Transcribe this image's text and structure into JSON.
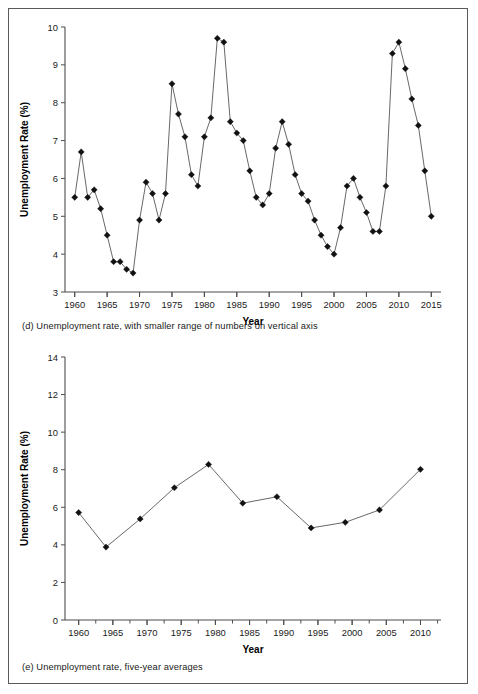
{
  "figure": {
    "panels": [
      {
        "id": "d",
        "caption": "(d) Unemployment rate, with smaller range of numbers on vertical axis"
      },
      {
        "id": "e",
        "caption": "(e) Unemployment rate, five-year averages"
      }
    ]
  },
  "chart_data": [
    {
      "type": "line",
      "title": "",
      "panel_label": "(d)",
      "xlabel": "Year",
      "ylabel": "Unemployment Rate (%)",
      "xlim": [
        1958.5,
        2016.5
      ],
      "ylim": [
        3,
        10
      ],
      "yticks": [
        3,
        4,
        5,
        6,
        7,
        8,
        9,
        10
      ],
      "ytick_labels": [
        "3",
        "4",
        "5",
        "6",
        "7",
        "8",
        "9",
        "10"
      ],
      "xticks": [
        1960,
        1965,
        1970,
        1975,
        1980,
        1985,
        1990,
        1995,
        2000,
        2005,
        2010,
        2015
      ],
      "xtick_labels": [
        "1960",
        "1965",
        "1970",
        "1975",
        "1980",
        "1985",
        "1990",
        "1995",
        "2000",
        "2005",
        "2010",
        "2015"
      ],
      "grid": false,
      "legend": false,
      "marker": "diamond",
      "x": [
        1960,
        1961,
        1962,
        1963,
        1964,
        1965,
        1966,
        1967,
        1968,
        1969,
        1970,
        1971,
        1972,
        1973,
        1974,
        1975,
        1976,
        1977,
        1978,
        1979,
        1980,
        1981,
        1982,
        1983,
        1984,
        1985,
        1986,
        1987,
        1988,
        1989,
        1990,
        1991,
        1992,
        1993,
        1994,
        1995,
        1996,
        1997,
        1998,
        1999,
        2000,
        2001,
        2002,
        2003,
        2004,
        2005,
        2006,
        2007,
        2008,
        2009,
        2010,
        2011,
        2012,
        2013,
        2014,
        2015
      ],
      "values": [
        5.5,
        6.7,
        5.5,
        5.7,
        5.2,
        4.5,
        3.8,
        3.8,
        3.6,
        3.5,
        4.9,
        5.9,
        5.6,
        4.9,
        5.6,
        8.5,
        7.7,
        7.1,
        6.1,
        5.8,
        7.1,
        7.6,
        9.7,
        9.6,
        7.5,
        7.2,
        7.0,
        6.2,
        5.5,
        5.3,
        5.6,
        6.8,
        7.5,
        6.9,
        6.1,
        5.6,
        5.4,
        4.9,
        4.5,
        4.2,
        4.0,
        4.7,
        5.8,
        6.0,
        5.5,
        5.1,
        4.6,
        4.6,
        5.8,
        9.3,
        9.6,
        8.9,
        8.1,
        7.4,
        6.2,
        5.0
      ],
      "xtick_minor_every": 1
    },
    {
      "type": "line",
      "title": "",
      "panel_label": "(e)",
      "xlabel": "Year",
      "ylabel": "Unemployment Rate (%)",
      "xlim": [
        1958,
        2013
      ],
      "ylim": [
        0,
        14
      ],
      "yticks": [
        0,
        2,
        4,
        6,
        8,
        10,
        12,
        14
      ],
      "ytick_labels": [
        "0",
        "2",
        "4",
        "6",
        "8",
        "10",
        "12",
        "14"
      ],
      "xticks": [
        1960,
        1965,
        1970,
        1975,
        1980,
        1985,
        1990,
        1995,
        2000,
        2005,
        2010
      ],
      "xtick_labels": [
        "1960",
        "1965",
        "1970",
        "1975",
        "1980",
        "1985",
        "1990",
        "1995",
        "2000",
        "2005",
        "2010"
      ],
      "grid": false,
      "legend": false,
      "marker": "diamond",
      "x": [
        1960,
        1964,
        1969,
        1974,
        1979,
        1984,
        1989,
        1994,
        1999,
        2004,
        2010
      ],
      "values": [
        5.72,
        3.88,
        5.38,
        7.04,
        8.28,
        6.22,
        6.56,
        4.9,
        5.2,
        5.86,
        8.02
      ],
      "xtick_minor_every": 2.5
    }
  ],
  "style": {
    "line_color": "#4d4d4d",
    "marker_color": "#111111",
    "axis_color": "#4d4d4d",
    "text_color": "#1a1a1a",
    "frame_color": "#595959",
    "background": "#ffffff"
  }
}
